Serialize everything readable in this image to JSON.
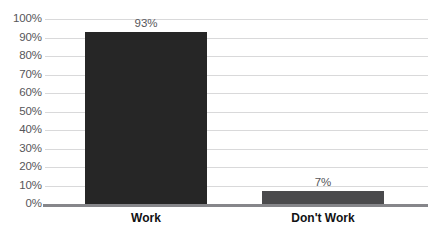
{
  "chart_data": {
    "type": "bar",
    "title": "",
    "subtitle": "",
    "xlabel": "",
    "ylabel": "",
    "categories": [
      "Work",
      "Don't Work"
    ],
    "values": [
      93,
      7
    ],
    "value_labels": [
      "93%",
      "7%"
    ],
    "ylim": [
      0,
      100
    ],
    "y_ticks": [
      0,
      10,
      20,
      30,
      40,
      50,
      60,
      70,
      80,
      90,
      100
    ],
    "y_tick_labels": [
      "0%",
      "10%",
      "20%",
      "30%",
      "40%",
      "50%",
      "60%",
      "70%",
      "80%",
      "90%",
      "100%"
    ],
    "grid": "horizontal",
    "legend": "none",
    "unit": "percent",
    "series": [
      {
        "name": "",
        "values": [
          93,
          7
        ],
        "bar_colors": [
          "#262626",
          "#4a4a4c"
        ]
      }
    ],
    "colors": {
      "background": "#ffffff",
      "gridline": "#d9d9da",
      "axis_line": "#86868a",
      "tick_text": "#56565a",
      "value_text": "#56565a",
      "category_text": "#111113",
      "bar_primary": "#262626",
      "bar_secondary": "#4a4a4c"
    }
  }
}
